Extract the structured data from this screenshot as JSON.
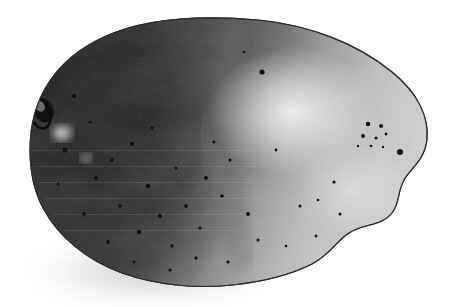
{
  "image": {
    "kind": "monochrome-photographic-plate",
    "subject": "ovoid specimen (seed / stone / egg)",
    "width_px": 450,
    "height_px": 307,
    "background_color": "#ffffff",
    "caption": "",
    "labels": []
  },
  "specimen": {
    "outline_color": "#2b2b2b",
    "outline_width_px": 1.1,
    "fill_dark": "#262626",
    "fill_mid": "#8d8d8d",
    "fill_light": "#d4d4d4",
    "highlight_color": "#f2f2f0",
    "bounds": {
      "left": 28,
      "top": 19,
      "right": 428,
      "bottom": 287
    },
    "orientation": "horizontal long axis",
    "shading_direction": "dark at left, light at right",
    "outline_path": "M 30,150 C 30,96 58,58 104,37 C 150,16 212,16 258,20 C 310,25 358,44 392,72 C 418,93 429,117 427,139 C 425,160 411,168 404,180 C 397,193 400,203 392,213 C 382,226 362,224 349,233 C 334,243 330,255 312,264 C 292,274 262,282 232,285 C 196,289 156,285 122,273 C 86,260 58,236 43,208 C 33,189 30,170 30,150 Z",
    "shadow": {
      "color": "rgba(140,140,140,0.45)",
      "offset_x": -6,
      "offset_y": 10
    }
  },
  "features": {
    "hilum": {
      "name": "hilum-notch",
      "x": 43,
      "y": 110,
      "rx": 10,
      "ry": 13,
      "rotation_deg": -28,
      "color": "#141414"
    },
    "specular_highlight": {
      "cx": 292,
      "cy": 112,
      "rx": 82,
      "ry": 62,
      "color": "#f4f4f2"
    },
    "secondary_highlight": {
      "cx": 352,
      "cy": 190,
      "rx": 58,
      "ry": 44,
      "color": "#e3e3e1"
    },
    "pale_blotch": {
      "cx": 62,
      "cy": 133,
      "rx": 9,
      "ry": 7,
      "color": "#e8e8e6"
    },
    "mottle_seam": {
      "description": "cloud-like tonal boundary running top-center to bottom-center",
      "color": "#6e6e6e"
    },
    "pores": [
      {
        "x": 74,
        "y": 96,
        "r": 2.0
      },
      {
        "x": 90,
        "y": 122,
        "r": 1.6
      },
      {
        "x": 65,
        "y": 150,
        "r": 2.4
      },
      {
        "x": 112,
        "y": 160,
        "r": 1.9
      },
      {
        "x": 96,
        "y": 178,
        "r": 1.7
      },
      {
        "x": 132,
        "y": 144,
        "r": 2.1
      },
      {
        "x": 148,
        "y": 186,
        "r": 2.3
      },
      {
        "x": 120,
        "y": 206,
        "r": 1.8
      },
      {
        "x": 160,
        "y": 216,
        "r": 2.0
      },
      {
        "x": 139,
        "y": 232,
        "r": 2.2
      },
      {
        "x": 172,
        "y": 246,
        "r": 1.7
      },
      {
        "x": 186,
        "y": 206,
        "r": 1.9
      },
      {
        "x": 200,
        "y": 228,
        "r": 1.6
      },
      {
        "x": 206,
        "y": 178,
        "r": 2.0
      },
      {
        "x": 222,
        "y": 196,
        "r": 1.8
      },
      {
        "x": 230,
        "y": 160,
        "r": 1.5
      },
      {
        "x": 176,
        "y": 168,
        "r": 1.6
      },
      {
        "x": 152,
        "y": 128,
        "r": 1.7
      },
      {
        "x": 108,
        "y": 242,
        "r": 1.9
      },
      {
        "x": 196,
        "y": 258,
        "r": 1.7
      },
      {
        "x": 228,
        "y": 262,
        "r": 1.6
      },
      {
        "x": 248,
        "y": 214,
        "r": 2.0
      },
      {
        "x": 258,
        "y": 240,
        "r": 1.5
      },
      {
        "x": 262,
        "y": 72,
        "r": 2.6
      },
      {
        "x": 276,
        "y": 150,
        "r": 1.4
      },
      {
        "x": 244,
        "y": 52,
        "r": 1.3
      },
      {
        "x": 300,
        "y": 206,
        "r": 1.5
      },
      {
        "x": 286,
        "y": 246,
        "r": 1.3
      },
      {
        "x": 316,
        "y": 236,
        "r": 1.4
      },
      {
        "x": 170,
        "y": 270,
        "r": 1.5
      },
      {
        "x": 134,
        "y": 262,
        "r": 1.4
      },
      {
        "x": 84,
        "y": 214,
        "r": 1.8
      },
      {
        "x": 58,
        "y": 184,
        "r": 1.6
      },
      {
        "x": 214,
        "y": 142,
        "r": 1.4
      }
    ],
    "pore_cluster_right": [
      {
        "x": 368,
        "y": 124,
        "r": 2.2
      },
      {
        "x": 381,
        "y": 126,
        "r": 2.0
      },
      {
        "x": 363,
        "y": 136,
        "r": 1.9
      },
      {
        "x": 376,
        "y": 138,
        "r": 1.5
      },
      {
        "x": 386,
        "y": 134,
        "r": 1.4
      },
      {
        "x": 371,
        "y": 146,
        "r": 1.3
      },
      {
        "x": 358,
        "y": 146,
        "r": 1.2
      },
      {
        "x": 383,
        "y": 147,
        "r": 1.2
      }
    ],
    "isolated_spots": [
      {
        "x": 400,
        "y": 152,
        "r": 3.0
      },
      {
        "x": 334,
        "y": 182,
        "r": 1.6
      },
      {
        "x": 340,
        "y": 214,
        "r": 1.5
      },
      {
        "x": 318,
        "y": 200,
        "r": 1.3
      }
    ],
    "pore_color": "#101010"
  }
}
